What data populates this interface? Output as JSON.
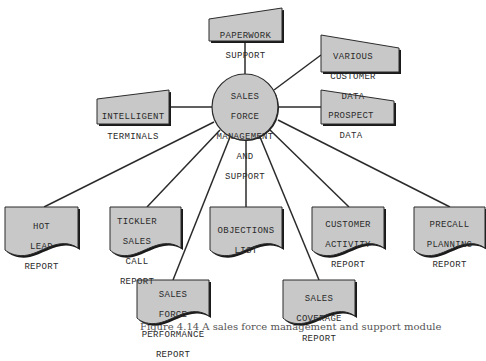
{
  "diagram": {
    "colors": {
      "fill": "#c8c8c8",
      "stroke": "#2b2b2b",
      "shadow": "#1a1a1a",
      "text": "#2a2a2a",
      "background": "#ffffff"
    },
    "center": {
      "label_lines": [
        "SALES",
        "FORCE",
        "MANAGEMENT",
        "AND",
        "SUPPORT"
      ],
      "shape": "circle"
    },
    "inputs": [
      {
        "id": "paperwork-support",
        "shape": "manual-input",
        "label_lines": [
          "PAPERWORK",
          "SUPPORT"
        ]
      },
      {
        "id": "various-customer-data",
        "shape": "manual-input",
        "label_lines": [
          "VARIOUS",
          "CUSTOMER",
          "DATA"
        ]
      },
      {
        "id": "prospect-data",
        "shape": "manual-input",
        "label_lines": [
          "PROSPECT",
          "DATA"
        ]
      },
      {
        "id": "intelligent-terminals",
        "shape": "manual-input",
        "label_lines": [
          "INTELLIGENT",
          "TERMINALS"
        ]
      }
    ],
    "outputs": [
      {
        "id": "hot-lead-report",
        "shape": "document",
        "label_lines": [
          "HOT",
          "LEAD",
          "REPORT"
        ]
      },
      {
        "id": "tickler-sales-call-report",
        "shape": "document",
        "label_lines": [
          "TICKLER",
          "SALES",
          "CALL",
          "REPORT"
        ]
      },
      {
        "id": "objections-list",
        "shape": "document",
        "label_lines": [
          "OBJECTIONS",
          "LIST"
        ]
      },
      {
        "id": "customer-activity-report",
        "shape": "document",
        "label_lines": [
          "CUSTOMER",
          "ACTIVITY",
          "REPORT"
        ]
      },
      {
        "id": "precall-planning-report",
        "shape": "document",
        "label_lines": [
          "PRECALL",
          "PLANNING",
          "REPORT"
        ]
      },
      {
        "id": "sales-force-performance-report",
        "shape": "document",
        "label_lines": [
          "SALES",
          "FORCE",
          "PERFORMANCE",
          "REPORT"
        ]
      },
      {
        "id": "sales-coverage-report",
        "shape": "document",
        "label_lines": [
          "SALES",
          "COVERAGE",
          "REPORT"
        ]
      }
    ],
    "caption": "Figure 4.14  A sales force management and support module"
  }
}
